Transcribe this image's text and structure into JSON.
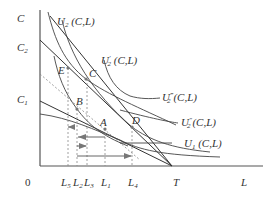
{
  "diagram": {
    "type": "labor-leisure indifference curve diagram",
    "axes": {
      "y_label": "C",
      "x_label": "L",
      "origin_label": "0",
      "y_ticks": [
        "C2",
        "C1"
      ],
      "x_ticks": [
        "L5",
        "L2",
        "L3",
        "L1",
        "L4",
        "T"
      ]
    },
    "y_tick_labels": {
      "c2": {
        "base": "C",
        "sub": "2"
      },
      "c1": {
        "base": "C",
        "sub": "1"
      }
    },
    "x_tick_labels": {
      "l5": {
        "base": "L",
        "sub": "5"
      },
      "l2": {
        "base": "L",
        "sub": "2"
      },
      "l3": {
        "base": "L",
        "sub": "3"
      },
      "l1": {
        "base": "L",
        "sub": "1"
      },
      "l4": {
        "base": "L",
        "sub": "4"
      },
      "t": "T"
    },
    "curves": [
      {
        "id": "U2",
        "base": "U",
        "sub": "2",
        "prime": "",
        "args": " (C,L)"
      },
      {
        "id": "U2p",
        "base": "U",
        "sub": "2",
        "prime": "′",
        "args": " (C,L)"
      },
      {
        "id": "U2ppp",
        "base": "U",
        "sub": "2",
        "prime": "‴",
        "args": "(C,L)"
      },
      {
        "id": "U2pp",
        "base": "U",
        "sub": "2",
        "prime": "″",
        "args": "(C,L)"
      },
      {
        "id": "U1",
        "base": "U",
        "sub": "1",
        "prime": "",
        "args": " (C,L)"
      }
    ],
    "points": {
      "E": "E",
      "C": "C",
      "B": "B",
      "A": "A",
      "D": "D"
    }
  }
}
